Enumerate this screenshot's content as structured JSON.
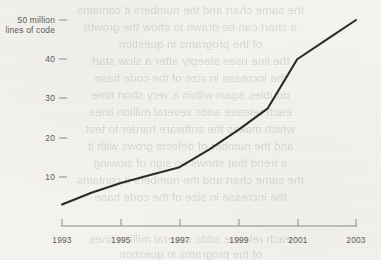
{
  "chart_data": {
    "type": "line",
    "title": "",
    "subtitle": "",
    "xlabel": "",
    "ylabel": "50 million lines of code",
    "y_axis_caption_line1": "50 million",
    "y_axis_caption_line2": "lines of code",
    "x": [
      1993,
      1994,
      1995,
      1996,
      1997,
      1998,
      1999,
      2000,
      2001,
      2002,
      2003
    ],
    "values": [
      3,
      6,
      8.5,
      10.5,
      12.5,
      17,
      22,
      27.5,
      40,
      45,
      50
    ],
    "series": [
      {
        "name": "lines of code",
        "values": [
          3,
          6,
          8.5,
          10.5,
          12.5,
          17,
          22,
          27.5,
          40,
          45,
          50
        ]
      }
    ],
    "xlim": [
      1993,
      2003
    ],
    "ylim": [
      0,
      50
    ],
    "x_ticks": [
      1993,
      1995,
      1997,
      1999,
      2001,
      2003
    ],
    "x_tick_labels": [
      "1993",
      "1995",
      "1997",
      "1999",
      "2001",
      "2003"
    ],
    "y_ticks": [
      10,
      20,
      30,
      40,
      50
    ],
    "y_tick_labels": [
      "10",
      "20",
      "30",
      "40",
      "50 million"
    ],
    "grid": false,
    "legend": false,
    "legend_position": "none",
    "line_color": "#2b2a28",
    "axis_color": "#8d8b86",
    "text_color": "#5d5b57",
    "background_color": "#f4f3ef"
  },
  "axis": {
    "y_labels": [
      {
        "value": 50,
        "text": "50 million"
      },
      {
        "value": 40,
        "text": "40"
      },
      {
        "value": 30,
        "text": "30"
      },
      {
        "value": 20,
        "text": "20"
      },
      {
        "value": 10,
        "text": "10"
      }
    ],
    "y_caption": "lines of code",
    "x_labels": [
      "1993",
      "1995",
      "1997",
      "1999",
      "2001",
      "2003"
    ]
  },
  "page": {
    "showthrough_lines": [
      "the same chart and the numbers it contains",
      "a chart can be drawn to show the growth",
      "of the programs in question",
      "the line rises steeply after a slow start",
      "the increase in size of the code base",
      "doubles again within a very short time",
      "each release adds several million lines",
      "which makes the software harder to test",
      "and the number of defects grows with it",
      "a trend that shows no sign of slowing"
    ]
  }
}
